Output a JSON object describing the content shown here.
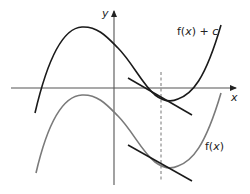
{
  "diagram": {
    "axes": {
      "x_label": "x",
      "y_label": "y"
    },
    "curves": [
      {
        "name": "shifted",
        "label": "f(x) + c",
        "label_parts": [
          "f(",
          "x",
          ") + ",
          "c"
        ],
        "color": "#1a1a1a"
      },
      {
        "name": "original",
        "label": "f(x)",
        "label_parts": [
          "f(",
          "x",
          ")"
        ],
        "color": "#7a7a7a"
      }
    ],
    "tangent_lines": [
      {
        "curve": "f(x) + c",
        "color": "#1a1a1a"
      },
      {
        "curve": "f(x)",
        "color": "#1a1a1a"
      }
    ],
    "vertical_guide": {
      "style": "dashed",
      "color": "#777777"
    }
  }
}
